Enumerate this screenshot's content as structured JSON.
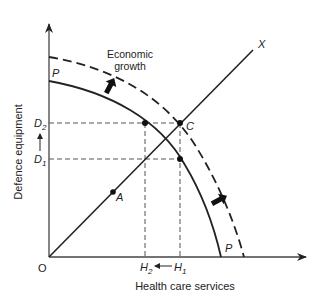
{
  "diagram": {
    "axes": {
      "x_label": "Health care services",
      "y_label": "Defence equipment",
      "origin_label": "O"
    },
    "curves": {
      "ppf_original_label": "P",
      "ppf_original_end_label": "P",
      "ppf_shifted_style": "dashed"
    },
    "ray_label": "X",
    "points": {
      "a_label": "A",
      "c_label": "C"
    },
    "y_ticks": {
      "d2": "D",
      "d2_sub": "2",
      "d1": "D",
      "d1_sub": "1"
    },
    "x_ticks": {
      "h2": "H",
      "h2_sub": "2",
      "h1": "H",
      "h1_sub": "1"
    },
    "annotation": {
      "line1": "Economic",
      "line2": "growth"
    },
    "colors": {
      "ink": "#222222",
      "background": "#ffffff"
    }
  }
}
